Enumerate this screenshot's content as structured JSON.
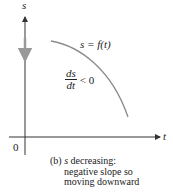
{
  "figure": {
    "axes": {
      "vertical_label": "s",
      "horizontal_label": "t",
      "origin_label": "0"
    },
    "curve_label": "s = f(t)",
    "derivative": {
      "numerator": "ds",
      "denominator": "dt",
      "relation": "< 0"
    },
    "motion_arrow": "downward",
    "caption": {
      "line1_prefix": "(b) ",
      "line1_var": "s",
      "line1_rest": " decreasing:",
      "line2": "negative slope so",
      "line3": "moving downward"
    },
    "colors": {
      "axis": "#333333",
      "curve": "#8a8a8a",
      "motion_arrow": "#999999",
      "text": "#222222"
    }
  }
}
